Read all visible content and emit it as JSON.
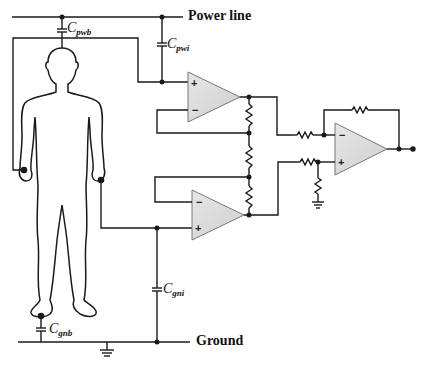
{
  "diagram": {
    "type": "circuit-schematic",
    "labels": {
      "power_line": "Power line",
      "ground": "Ground"
    },
    "capacitors": [
      {
        "id": "cpwb",
        "symbol": "C",
        "subscript": "pwb"
      },
      {
        "id": "cpwi",
        "symbol": "C",
        "subscript": "pwi"
      },
      {
        "id": "cgni",
        "symbol": "C",
        "subscript": "gni"
      },
      {
        "id": "cgnb",
        "symbol": "C",
        "subscript": "gnb"
      }
    ],
    "op_amps": [
      {
        "id": "opamp-top",
        "plus": "+",
        "minus": "−"
      },
      {
        "id": "opamp-bottom",
        "plus": "+",
        "minus": "−"
      },
      {
        "id": "opamp-output",
        "plus": "+",
        "minus": "−"
      }
    ],
    "colors": {
      "wire": "#1a1a1a",
      "opamp_fill": "#d9d9d9",
      "background": "#ffffff"
    }
  }
}
